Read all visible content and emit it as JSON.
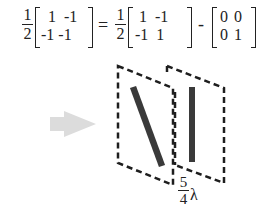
{
  "equation": {
    "lhs": {
      "coefficient": {
        "numerator": "1",
        "denominator": "2"
      },
      "matrix": {
        "rows": [
          [
            "1",
            "-1"
          ],
          [
            "-1",
            "-1"
          ]
        ],
        "row_text": [
          "1  -1",
          "-1 -1"
        ]
      }
    },
    "equals": "=",
    "rhs_term1": {
      "coefficient": {
        "numerator": "1",
        "denominator": "2"
      },
      "matrix": {
        "rows": [
          [
            "1",
            "-1"
          ],
          [
            "-1",
            "1"
          ]
        ],
        "row_text": [
          " 1  -1",
          "-1  1"
        ]
      }
    },
    "minus": "-",
    "rhs_term2": {
      "matrix": {
        "rows": [
          [
            "0",
            "0"
          ],
          [
            "0",
            "1"
          ]
        ],
        "row_text": [
          "0 0",
          "0 1"
        ]
      }
    }
  },
  "diagram": {
    "arrow": {
      "direction": "right",
      "color": "#d9d9d9"
    },
    "panels": [
      {
        "label": "polarizer-panel",
        "bar_orientation": "diagonal",
        "border_style": "dashed"
      },
      {
        "label": "waveplate-panel",
        "bar_orientation": "vertical",
        "border_style": "dashed"
      }
    ],
    "spacing_label": {
      "numerator": "5",
      "denominator": "4",
      "symbol": "λ"
    },
    "colors": {
      "bar": "#3a3a3a",
      "dash": "#1e1e1e",
      "arrow": "#d9d9d9"
    }
  }
}
